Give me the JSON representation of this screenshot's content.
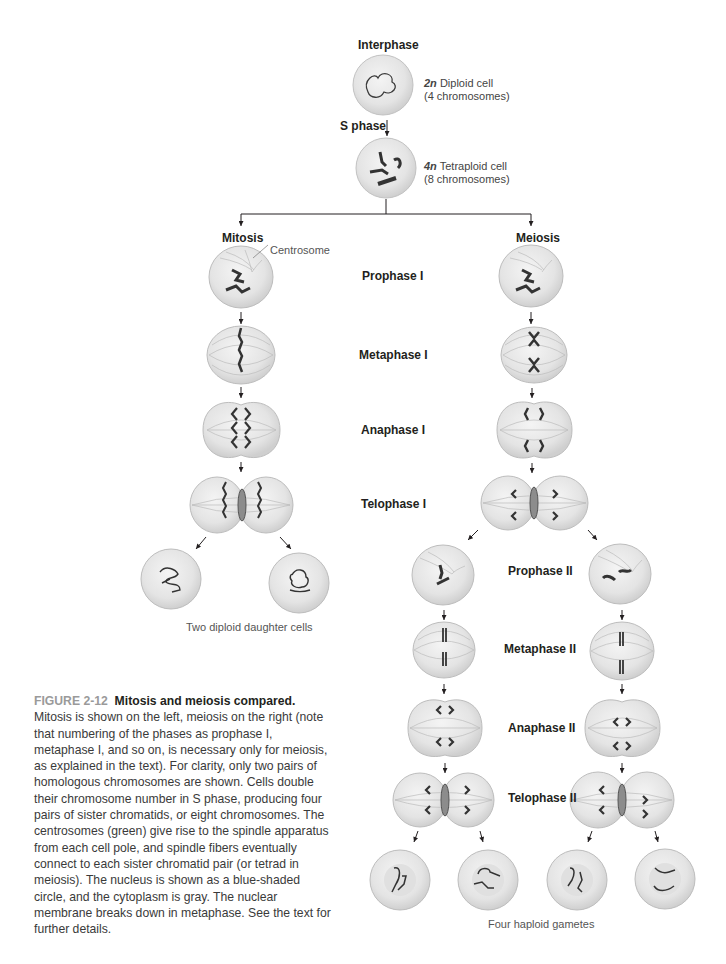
{
  "figure": {
    "number": "FIGURE 2-12",
    "title": "Mitosis and meiosis compared.",
    "caption": "Mitosis is shown on the left, meiosis on the right (note that numbering of the phases as prophase I, metaphase I, and so on, is necessary only for meiosis, as explained in the text). For clarity, only two pairs of homologous chromosomes are shown. Cells double their chromosome number in S phase, producing four pairs of sister chromatids, or eight chromosomes. The centrosomes (green) give rise to the spindle apparatus from each cell pole, and spindle fibers eventually connect to each sister chromatid pair (or tetrad in meiosis). The nucleus is shown as a blue-shaded circle, and the cytoplasm is gray. The nuclear membrane breaks down in metaphase. See the text for further details."
  },
  "top": {
    "interphase_label": "Interphase",
    "diploid": {
      "ploidy": "2n",
      "text": "Diploid cell",
      "count": "(4 chromosomes)"
    },
    "s_phase_label": "S phase",
    "tetraploid": {
      "ploidy": "4n",
      "text": "Tetraploid cell",
      "count": "(8 chromosomes)"
    }
  },
  "branches": {
    "mitosis_label": "Mitosis",
    "meiosis_label": "Meiosis",
    "centrosome_label": "Centrosome"
  },
  "phases": {
    "prophase_1": "Prophase I",
    "metaphase_1": "Metaphase I",
    "anaphase_1": "Anaphase I",
    "telophase_1": "Telophase I",
    "prophase_2": "Prophase II",
    "metaphase_2": "Metaphase II",
    "anaphase_2": "Anaphase II",
    "telophase_2": "Telophase II"
  },
  "outcomes": {
    "mitosis_result": "Two  diploid daughter cells",
    "meiosis_result": "Four haploid gametes"
  },
  "colors": {
    "cell_fill": "#e6e6e6",
    "cell_stroke": "#b9b9b9",
    "chromosome": "#3a3a3a",
    "arrow": "#231f20",
    "caption_figure_number": "#9a9a9a"
  }
}
